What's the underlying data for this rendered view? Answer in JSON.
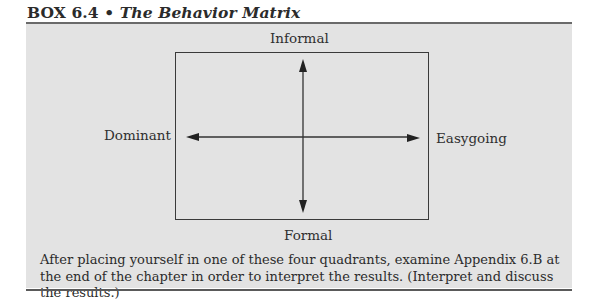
{
  "box": {
    "number": "BOX 6.4",
    "separator": "•",
    "title": "The Behavior Matrix"
  },
  "matrix": {
    "top_label": "Informal",
    "bottom_label": "Formal",
    "left_label": "Dominant",
    "right_label": "Easygoing",
    "axes": {
      "vertical": {
        "from": "Formal",
        "to": "Informal",
        "arrowheads": "both"
      },
      "horizontal": {
        "from": "Dominant",
        "to": "Easygoing",
        "arrowheads": "both"
      }
    }
  },
  "caption": "After placing yourself in one of these four quadrants, examine Appendix 6.B at the end of the chapter in order to interpret the results. (Interpret and discuss the results.)",
  "colors": {
    "panel_background": "#e3e3e3",
    "rule": "#6a6a6a",
    "text": "#2b2b2b"
  }
}
